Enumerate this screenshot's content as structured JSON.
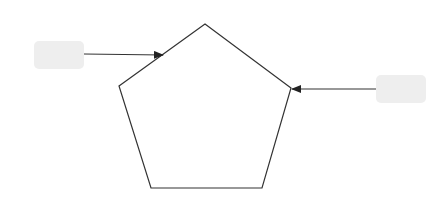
{
  "diagram": {
    "shape": "pentagon",
    "stroke_color": "#333333",
    "box_fill": "#eeeeee",
    "nodes": [
      {
        "id": "left-box",
        "label": ""
      },
      {
        "id": "right-box",
        "label": ""
      }
    ],
    "edges": [
      {
        "from": "left-box",
        "to": "pentagon"
      },
      {
        "from": "right-box",
        "to": "pentagon"
      }
    ]
  }
}
